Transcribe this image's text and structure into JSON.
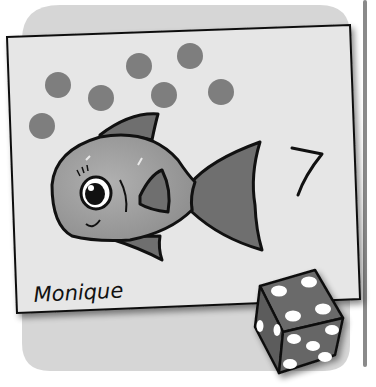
{
  "scene": {
    "description": "Counting card illustration: a fish with seven dots and the number 7, signed by a child, with a die",
    "card": {
      "number_label": "7",
      "signature": "Monique",
      "dot_count": 7
    },
    "die": {
      "top_face_pips": 4,
      "left_face_pips": 2,
      "front_face_pips": 5
    },
    "colors": {
      "background_panel": "#d6d6d6",
      "card": "#e6e6e6",
      "dot": "#7e7e7e",
      "fish_body": "#9c9c9c",
      "fish_fin": "#6f6f6f",
      "die_face": "#6a6a6a",
      "outline": "#111111",
      "side_bar": "#8a8a8a"
    }
  }
}
